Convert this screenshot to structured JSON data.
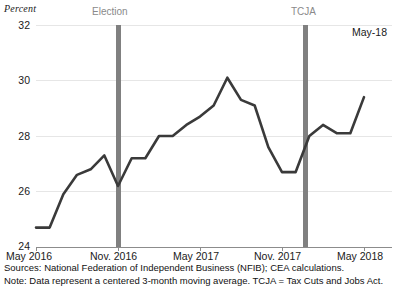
{
  "chart_data": {
    "type": "line",
    "title": "",
    "ylabel": "Percent",
    "xlabel": "",
    "ylim": [
      24,
      32
    ],
    "ytick_labels": [
      "32",
      "30",
      "28",
      "26",
      "24"
    ],
    "ytick_values": [
      32,
      30,
      28,
      26,
      24
    ],
    "xtick_labels": [
      "May 2016",
      "Nov. 2016",
      "May 2017",
      "Nov. 2017",
      "May 2018"
    ],
    "grid": true,
    "legend": "none",
    "x": [
      "May 2016",
      "Jun 2016",
      "Jul 2016",
      "Aug 2016",
      "Sep 2016",
      "Oct 2016",
      "Nov. 2016",
      "Dec 2016",
      "Jan 2017",
      "Feb 2017",
      "Mar 2017",
      "Apr 2017",
      "May 2017",
      "Jun 2017",
      "Jul 2017",
      "Aug 2017",
      "Sep 2017",
      "Oct 2017",
      "Nov. 2017",
      "Dec 2017",
      "Jan 2018",
      "Feb 2018",
      "Mar 2018",
      "Apr 2018",
      "May 2018"
    ],
    "values": [
      24.7,
      24.7,
      25.9,
      26.6,
      26.8,
      27.3,
      26.2,
      27.2,
      27.2,
      28.0,
      28.0,
      28.4,
      28.7,
      29.1,
      30.1,
      29.3,
      29.1,
      27.6,
      26.7,
      26.7,
      28.0,
      28.4,
      28.1,
      28.1,
      29.4
    ],
    "annotations": [
      {
        "name": "Election",
        "label": "Election",
        "x": "Nov. 2016",
        "type": "vertical-band",
        "color": "#808080"
      },
      {
        "name": "TCJA",
        "label": "TCJA",
        "x": "Dec 2017",
        "type": "vertical-band",
        "color": "#808080"
      },
      {
        "name": "end-point",
        "label": "May-18",
        "type": "text"
      }
    ],
    "line_color": "#3a3a3a",
    "grid_color": "#e6e6e6",
    "axis_color": "#8c8c8c"
  },
  "footnotes": {
    "sources": "Sources: National Federation of Independent Business (NFIB); CEA calculations.",
    "note": "Note: Data represent a centered 3-month moving average. TCJA = Tax Cuts and Jobs Act."
  }
}
